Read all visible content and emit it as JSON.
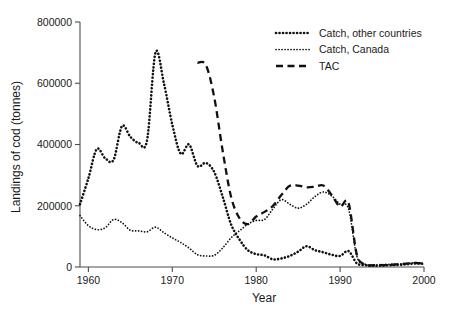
{
  "chart_data": {
    "type": "line",
    "title": "",
    "xlabel": "Year",
    "ylabel": "Landings of cod (tonnes)",
    "xlim": [
      1959,
      2000
    ],
    "ylim": [
      0,
      800000
    ],
    "xticks": [
      1960,
      1970,
      1980,
      1990,
      2000
    ],
    "xtick_labels": [
      "1960",
      "1970",
      "1980",
      "1990",
      "2000"
    ],
    "yticks": [
      0,
      200000,
      400000,
      600000,
      800000
    ],
    "ytick_labels": [
      "0",
      "200000",
      "400000",
      "600000",
      "800000"
    ],
    "grid": false,
    "legend_position": "top-right",
    "series": [
      {
        "name": "Catch, other countries",
        "style": "dotted-bold",
        "color": "#111111",
        "x": [
          1959,
          1960,
          1961,
          1962,
          1963,
          1964,
          1965,
          1966,
          1967,
          1968,
          1969,
          1970,
          1971,
          1972,
          1973,
          1974,
          1975,
          1976,
          1977,
          1978,
          1979,
          1980,
          1981,
          1982,
          1983,
          1984,
          1985,
          1986,
          1987,
          1988,
          1989,
          1990,
          1991,
          1992,
          1993,
          1994,
          1995,
          1996,
          1997,
          1998,
          1999,
          2000
        ],
        "values": [
          205000,
          290000,
          385000,
          355000,
          350000,
          460000,
          425000,
          405000,
          415000,
          700000,
          600000,
          465000,
          370000,
          400000,
          330000,
          340000,
          310000,
          230000,
          140000,
          90000,
          55000,
          42000,
          38000,
          25000,
          28000,
          36000,
          50000,
          68000,
          55000,
          48000,
          40000,
          36000,
          52000,
          12000,
          6000,
          4000,
          5000,
          6000,
          7000,
          9000,
          12000,
          10000
        ]
      },
      {
        "name": "Catch, Canada",
        "style": "dotted-fine",
        "color": "#111111",
        "x": [
          1959,
          1960,
          1961,
          1962,
          1963,
          1964,
          1965,
          1966,
          1967,
          1968,
          1969,
          1970,
          1971,
          1972,
          1973,
          1974,
          1975,
          1976,
          1977,
          1978,
          1979,
          1980,
          1981,
          1982,
          1983,
          1984,
          1985,
          1986,
          1987,
          1988,
          1989,
          1990,
          1991,
          1992,
          1993,
          1994,
          1995,
          1996,
          1997,
          1998,
          1999,
          2000
        ],
        "values": [
          168000,
          135000,
          122000,
          128000,
          155000,
          145000,
          120000,
          118000,
          115000,
          130000,
          112000,
          95000,
          80000,
          62000,
          40000,
          36000,
          38000,
          62000,
          95000,
          118000,
          140000,
          152000,
          155000,
          190000,
          220000,
          205000,
          192000,
          205000,
          230000,
          245000,
          232000,
          205000,
          190000,
          35000,
          9000,
          7000,
          8000,
          9000,
          10000,
          12000,
          14000,
          12000
        ]
      },
      {
        "name": "TAC",
        "style": "dashed",
        "color": "#111111",
        "x": [
          1973,
          1974,
          1975,
          1976,
          1977,
          1978,
          1979,
          1980,
          1981,
          1982,
          1983,
          1984,
          1985,
          1986,
          1987,
          1988,
          1989,
          1990,
          1991,
          1992,
          1993,
          1994,
          1995,
          1996,
          1997,
          1998,
          1999,
          2000
        ],
        "values": [
          667000,
          660000,
          554000,
          380000,
          230000,
          160000,
          140000,
          165000,
          180000,
          200000,
          235000,
          265000,
          266000,
          260000,
          262000,
          266000,
          235000,
          197000,
          210000,
          40000,
          8000,
          6000,
          6000,
          7000,
          9000,
          11000,
          13000,
          11000
        ]
      }
    ]
  },
  "legend": {
    "items": [
      {
        "label": "Catch, other countries",
        "marker": "dotted-bold-marker"
      },
      {
        "label": "Catch, Canada",
        "marker": "dotted-fine-marker"
      },
      {
        "label": "TAC",
        "marker": "dashed-marker"
      }
    ]
  },
  "axes": {
    "x_title": "Year",
    "y_title": "Landings of cod (tonnes)"
  }
}
